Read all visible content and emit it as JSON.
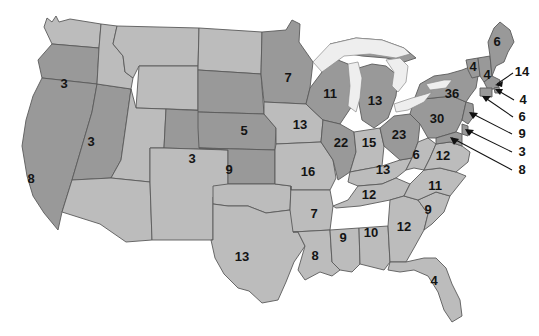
{
  "map": {
    "title": "United States electoral vote map",
    "colors": {
      "shade_dark": "#999999",
      "shade_light": "#bcbcbc",
      "border": "#5a5a5a",
      "lake": "#eeeeee",
      "background": "#ffffff",
      "label_text": "#141414",
      "leader_line": "#111111"
    },
    "legend_shades": [
      "dark",
      "light"
    ],
    "states": [
      {
        "code": "WA",
        "name": "Washington",
        "value": "",
        "shade": "light",
        "x": 72,
        "y": 40,
        "labeled": false
      },
      {
        "code": "OR",
        "name": "Oregon",
        "value": "3",
        "shade": "dark",
        "x": 64,
        "y": 85,
        "labeled": true
      },
      {
        "code": "CA",
        "name": "California",
        "value": "8",
        "shade": "dark",
        "x": 31,
        "y": 180,
        "labeled": true
      },
      {
        "code": "NV",
        "name": "Nevada",
        "value": "3",
        "shade": "dark",
        "x": 91,
        "y": 143,
        "labeled": true
      },
      {
        "code": "ID",
        "name": "Idaho",
        "value": "",
        "shade": "light",
        "x": 110,
        "y": 77,
        "labeled": false
      },
      {
        "code": "MT",
        "name": "Montana",
        "value": "",
        "shade": "light",
        "x": 163,
        "y": 52,
        "labeled": false
      },
      {
        "code": "WY",
        "name": "Wyoming",
        "value": "",
        "shade": "light",
        "x": 155,
        "y": 110,
        "labeled": false
      },
      {
        "code": "UT",
        "name": "Utah",
        "value": "",
        "shade": "light",
        "x": 120,
        "y": 155,
        "labeled": false
      },
      {
        "code": "AZ",
        "name": "Arizona",
        "value": "",
        "shade": "light",
        "x": 113,
        "y": 212,
        "labeled": false
      },
      {
        "code": "CO",
        "name": "Colorado",
        "value": "3",
        "shade": "dark",
        "x": 192,
        "y": 160,
        "labeled": true
      },
      {
        "code": "NM",
        "name": "New Mexico",
        "value": "",
        "shade": "light",
        "x": 170,
        "y": 218,
        "labeled": false
      },
      {
        "code": "ND",
        "name": "North Dakota",
        "value": "",
        "shade": "light",
        "x": 228,
        "y": 72,
        "labeled": false
      },
      {
        "code": "SD",
        "name": "South Dakota",
        "value": "5",
        "shade": "dark",
        "x": 244,
        "y": 132,
        "labeled": true
      },
      {
        "code": "NE",
        "name": "Nebraska",
        "value": "9",
        "shade": "dark",
        "x": 229,
        "y": 171,
        "labeled": true
      },
      {
        "code": "KS",
        "name": "Kansas",
        "value": "9",
        "shade": "dark",
        "x": 229,
        "y": 171,
        "labeled": true
      },
      {
        "code": "OK",
        "name": "Oklahoma",
        "value": "",
        "shade": "light",
        "x": 247,
        "y": 203,
        "labeled": false
      },
      {
        "code": "TX",
        "name": "Texas",
        "value": "13",
        "shade": "light",
        "x": 242,
        "y": 258,
        "labeled": true
      },
      {
        "code": "MN",
        "name": "Minnesota",
        "value": "7",
        "shade": "dark",
        "x": 288,
        "y": 79,
        "labeled": true
      },
      {
        "code": "IA",
        "name": "Iowa",
        "value": "13",
        "shade": "light",
        "x": 300,
        "y": 126,
        "labeled": true
      },
      {
        "code": "MO",
        "name": "Missouri",
        "value": "16",
        "shade": "light",
        "x": 308,
        "y": 173,
        "labeled": true
      },
      {
        "code": "AR",
        "name": "Arkansas",
        "value": "7",
        "shade": "light",
        "x": 314,
        "y": 215,
        "labeled": true
      },
      {
        "code": "LA",
        "name": "Louisiana",
        "value": "8",
        "shade": "light",
        "x": 315,
        "y": 257,
        "labeled": true
      },
      {
        "code": "WI",
        "name": "Wisconsin",
        "value": "11",
        "shade": "dark",
        "x": 330,
        "y": 95,
        "labeled": true
      },
      {
        "code": "IL",
        "name": "Illinois",
        "value": "22",
        "shade": "dark",
        "x": 341,
        "y": 144,
        "labeled": true
      },
      {
        "code": "MS",
        "name": "Mississippi",
        "value": "9",
        "shade": "light",
        "x": 343,
        "y": 239,
        "labeled": true
      },
      {
        "code": "MI",
        "name": "Michigan",
        "value": "13",
        "shade": "dark",
        "x": 375,
        "y": 102,
        "labeled": true
      },
      {
        "code": "IN",
        "name": "Indiana",
        "value": "15",
        "shade": "light",
        "x": 369,
        "y": 144,
        "labeled": true
      },
      {
        "code": "KY",
        "name": "Kentucky",
        "value": "13",
        "shade": "light",
        "x": 383,
        "y": 171,
        "labeled": true
      },
      {
        "code": "TN",
        "name": "Tennessee",
        "value": "12",
        "shade": "light",
        "x": 371,
        "y": 195,
        "labeled": true
      },
      {
        "code": "AL",
        "name": "Alabama",
        "value": "10",
        "shade": "light",
        "x": 371,
        "y": 234,
        "labeled": true
      },
      {
        "code": "OH",
        "name": "Ohio",
        "value": "23",
        "shade": "dark",
        "x": 399,
        "y": 136,
        "labeled": true
      },
      {
        "code": "WV",
        "name": "West Virginia",
        "value": "6",
        "shade": "light",
        "x": 416,
        "y": 156,
        "labeled": true
      },
      {
        "code": "GA",
        "name": "Georgia",
        "value": "12",
        "shade": "light",
        "x": 404,
        "y": 228,
        "labeled": true
      },
      {
        "code": "FL",
        "name": "Florida",
        "value": "4",
        "shade": "light",
        "x": 434,
        "y": 282,
        "labeled": true
      },
      {
        "code": "SC",
        "name": "South Carolina",
        "value": "9",
        "shade": "light",
        "x": 428,
        "y": 211,
        "labeled": true
      },
      {
        "code": "NC",
        "name": "North Carolina",
        "value": "11",
        "shade": "light",
        "x": 435,
        "y": 187,
        "labeled": true
      },
      {
        "code": "VA",
        "name": "Virginia",
        "value": "12",
        "shade": "light",
        "x": 440,
        "y": 158,
        "labeled": true
      },
      {
        "code": "PA",
        "name": "Pennsylvania",
        "value": "30",
        "shade": "dark",
        "x": 437,
        "y": 120,
        "labeled": true
      },
      {
        "code": "NY",
        "name": "New York",
        "value": "36",
        "shade": "dark",
        "x": 452,
        "y": 95,
        "labeled": true
      },
      {
        "code": "VT",
        "name": "Vermont",
        "value": "4",
        "shade": "dark",
        "x": 473,
        "y": 68,
        "labeled": true
      },
      {
        "code": "NH",
        "name": "New Hampshire",
        "value": "4",
        "shade": "dark",
        "x": 485,
        "y": 74,
        "labeled": true
      },
      {
        "code": "ME",
        "name": "Maine",
        "value": "6",
        "shade": "dark",
        "x": 497,
        "y": 43,
        "labeled": true
      }
    ],
    "callouts": [
      {
        "code": "MA",
        "name": "Massachusetts",
        "value": "14",
        "label_x": 521,
        "label_y": 74,
        "leader": "M 515 78 L 498 85"
      },
      {
        "code": "RI",
        "name": "Rhode Island",
        "value": "4",
        "label_x": 523,
        "label_y": 101,
        "leader": "M 516 100 L 495 91"
      },
      {
        "code": "CT",
        "name": "Connecticut",
        "value": "6",
        "label_x": 521,
        "label_y": 118,
        "leader": "M 513 115 L 482 97"
      },
      {
        "code": "NJ",
        "name": "New Jersey",
        "value": "9",
        "label_x": 521,
        "label_y": 136,
        "leader": "M 512 133 L 469 118"
      },
      {
        "code": "DE",
        "name": "Delaware",
        "value": "3",
        "label_x": 521,
        "label_y": 153,
        "leader": "M 512 150 L 466 132"
      },
      {
        "code": "MD",
        "name": "Maryland",
        "value": "8",
        "label_x": 521,
        "label_y": 171,
        "leader": "M 512 168 L 450 140"
      }
    ]
  }
}
